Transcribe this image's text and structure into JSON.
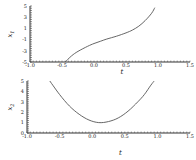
{
  "chart_data": [
    {
      "type": "line",
      "title": "",
      "xlabel": "t",
      "ylabel": "x1",
      "xlim": [
        -1.0,
        1.5
      ],
      "ylim": [
        -5,
        5
      ],
      "xticks": [
        "-1.0",
        "-0.5",
        "0.0",
        "0.5",
        "1.0",
        "1.5"
      ],
      "yticks": [
        "5",
        "3",
        "1",
        "-1",
        "-3",
        "-5"
      ],
      "grid": false,
      "series": [
        {
          "name": "x1(t)",
          "color": "#555555",
          "x": [
            -0.45,
            -0.35,
            -0.25,
            -0.1,
            0.0,
            0.1,
            0.2,
            0.35,
            0.5,
            0.6,
            0.7,
            0.8,
            0.9,
            0.95
          ],
          "y": [
            -5.0,
            -3.9,
            -3.1,
            -2.2,
            -1.7,
            -1.3,
            -0.9,
            -0.4,
            0.2,
            0.7,
            1.4,
            2.4,
            3.7,
            4.7
          ]
        }
      ]
    },
    {
      "type": "line",
      "title": "",
      "xlabel": "t",
      "ylabel": "x2",
      "xlim": [
        -1.0,
        1.5
      ],
      "ylim": [
        0,
        5
      ],
      "xticks": [
        "-1.0",
        "-0.5",
        "0.0",
        "0.5",
        "1.0",
        "1.5"
      ],
      "yticks": [
        "5",
        "4",
        "3",
        "2",
        "1",
        "0"
      ],
      "grid": false,
      "series": [
        {
          "name": "x2(t)",
          "color": "#555555",
          "x": [
            -0.65,
            -0.5,
            -0.35,
            -0.2,
            -0.05,
            0.1,
            0.25,
            0.4,
            0.55,
            0.7,
            0.8,
            0.9,
            0.95
          ],
          "y": [
            5.0,
            3.7,
            2.6,
            1.8,
            1.25,
            1.0,
            1.1,
            1.45,
            2.1,
            3.0,
            3.7,
            4.6,
            5.0
          ]
        }
      ]
    }
  ]
}
